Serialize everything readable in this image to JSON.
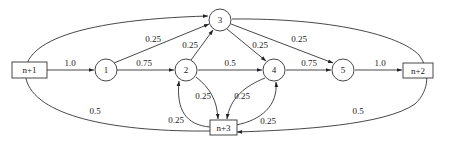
{
  "diagram": {
    "type": "directed-graph",
    "nodes": [
      {
        "id": "n+1",
        "label": "n+1",
        "shape": "box"
      },
      {
        "id": "1",
        "label": "1",
        "shape": "circle"
      },
      {
        "id": "2",
        "label": "2",
        "shape": "circle"
      },
      {
        "id": "3",
        "label": "3",
        "shape": "circle"
      },
      {
        "id": "4",
        "label": "4",
        "shape": "circle"
      },
      {
        "id": "5",
        "label": "5",
        "shape": "circle"
      },
      {
        "id": "n+2",
        "label": "n+2",
        "shape": "box"
      },
      {
        "id": "n+3",
        "label": "n+3",
        "shape": "box"
      }
    ],
    "edges": [
      {
        "from": "n+1",
        "to": "1",
        "weight": "1.0"
      },
      {
        "from": "1",
        "to": "2",
        "weight": "0.75"
      },
      {
        "from": "1",
        "to": "3",
        "weight": "0.25"
      },
      {
        "from": "2",
        "to": "3",
        "weight": "0.25"
      },
      {
        "from": "2",
        "to": "4",
        "weight": "0.5"
      },
      {
        "from": "2",
        "to": "n+3",
        "weight": "0.25"
      },
      {
        "from": "3",
        "to": "4",
        "weight": "0.25"
      },
      {
        "from": "3",
        "to": "5",
        "weight": "0.25"
      },
      {
        "from": "4",
        "to": "5",
        "weight": "0.75"
      },
      {
        "from": "4",
        "to": "n+3",
        "weight": "0.25"
      },
      {
        "from": "5",
        "to": "n+2",
        "weight": "1.0"
      },
      {
        "from": "n+3",
        "to": "2",
        "weight": "0.25"
      },
      {
        "from": "n+3",
        "to": "4",
        "weight": "0.25"
      },
      {
        "from": "n+3",
        "to": "3",
        "weight": "0.5"
      },
      {
        "from": "n+2",
        "to": "n+3",
        "weight": "0.5"
      }
    ]
  }
}
